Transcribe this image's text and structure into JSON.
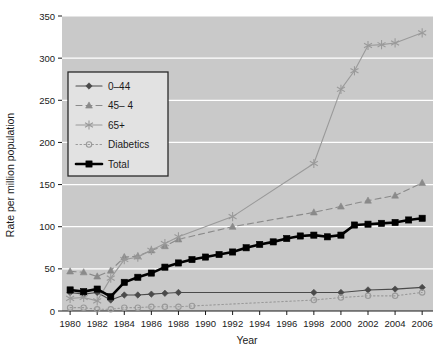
{
  "chart_data": {
    "type": "line",
    "title": "",
    "xlabel": "Year",
    "ylabel": "Rate per million population",
    "xlim": [
      1979.4,
      2006.8
    ],
    "ylim": [
      0,
      350
    ],
    "yticks": [
      0,
      50,
      100,
      150,
      200,
      250,
      300,
      350
    ],
    "xticks": [
      1980,
      1982,
      1984,
      1986,
      1988,
      1990,
      1992,
      1994,
      1996,
      1998,
      2000,
      2002,
      2004,
      2006
    ],
    "grid": "horizontal-white",
    "plot_background": "#c9c9c9",
    "legend_position": "upper-left-inside",
    "x": [
      1980,
      1981,
      1982,
      1983,
      1984,
      1985,
      1986,
      1987,
      1988,
      1989,
      1990,
      1991,
      1992,
      1993,
      1994,
      1995,
      1996,
      1997,
      1998,
      1999,
      2000,
      2001,
      2002,
      2003,
      2004,
      2005,
      2006
    ],
    "series": [
      {
        "name": "0–44",
        "marker": "diamond",
        "linestyle": "solid",
        "color": "#4a4a4a",
        "values": [
          22,
          20,
          22,
          13,
          19,
          19,
          20,
          21,
          22,
          null,
          null,
          null,
          null,
          null,
          null,
          null,
          null,
          null,
          22,
          null,
          22,
          null,
          25,
          null,
          26,
          null,
          28
        ]
      },
      {
        "name": "45– 4",
        "marker": "triangle",
        "linestyle": "dashed",
        "color": "#8a8a8a",
        "values": [
          47,
          46,
          41,
          48,
          64,
          65,
          72,
          77,
          85,
          null,
          null,
          null,
          100,
          null,
          null,
          null,
          null,
          null,
          117,
          null,
          124,
          null,
          131,
          null,
          137,
          null,
          152
        ]
      },
      {
        "name": "65+",
        "marker": "star",
        "linestyle": "solid",
        "color": "#9a9a9a",
        "values": [
          15,
          16,
          12,
          39,
          61,
          64,
          72,
          80,
          88,
          null,
          null,
          null,
          112,
          null,
          null,
          null,
          null,
          null,
          175,
          null,
          263,
          285,
          315,
          316,
          318,
          null,
          330
        ]
      },
      {
        "name": "Diabetics",
        "marker": "circle-open",
        "linestyle": "dotted",
        "color": "#9a9a9a",
        "values": [
          4,
          4,
          2,
          2,
          4,
          4,
          5,
          5,
          5,
          6,
          null,
          null,
          null,
          null,
          null,
          null,
          null,
          null,
          13,
          null,
          16,
          null,
          18,
          null,
          18,
          null,
          22
        ]
      },
      {
        "name": "Total",
        "marker": "square",
        "linestyle": "solid-thick",
        "color": "#000000",
        "values": [
          25,
          23,
          26,
          17,
          34,
          40,
          45,
          52,
          57,
          61,
          64,
          67,
          70,
          75,
          79,
          82,
          86,
          89,
          90,
          88,
          90,
          102,
          103,
          104,
          105,
          108,
          110
        ]
      }
    ]
  },
  "legend": {
    "entries": [
      {
        "label": "0–44"
      },
      {
        "label": "45– 4"
      },
      {
        "label": "65+"
      },
      {
        "label": "Diabetics"
      },
      {
        "label": "Total"
      }
    ]
  }
}
